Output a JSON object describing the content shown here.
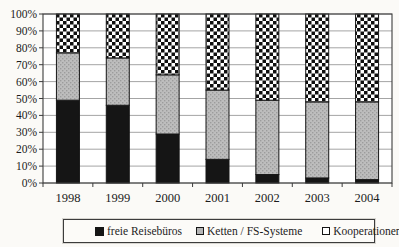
{
  "chart_data": {
    "type": "bar",
    "subtype": "stacked-100-percent",
    "title": "",
    "xlabel": "",
    "ylabel": "",
    "categories": [
      "1998",
      "1999",
      "2000",
      "2001",
      "2002",
      "2003",
      "2004"
    ],
    "series": [
      {
        "name": "freie Reisebüros",
        "style": "solid-black",
        "values": [
          49,
          46,
          29,
          14,
          5,
          3,
          2
        ]
      },
      {
        "name": "Ketten / FS-Systeme",
        "style": "gray-halftone",
        "values": [
          28,
          28,
          35,
          41,
          44,
          45,
          46
        ]
      },
      {
        "name": "Kooperationen",
        "style": "checkerboard",
        "values": [
          23,
          26,
          36,
          45,
          51,
          52,
          52
        ]
      }
    ],
    "y_tick_labels": [
      "100%",
      "90%",
      "80%",
      "70%",
      "60%",
      "50%",
      "40%",
      "30%",
      "20%",
      "10%",
      "0%"
    ],
    "ylim": [
      0,
      100
    ],
    "grid": "horizontal",
    "legend_position": "bottom"
  },
  "colors": {
    "series_black": "#151515",
    "series_gray": "#b5b5b5",
    "checker_black": "#0f0f0f",
    "plot_background": "#ffffff",
    "page_background": "#fbfaf7",
    "gridline": "#9a9a9a",
    "axis": "#3c3c3c",
    "bar_outline": "#161616"
  }
}
